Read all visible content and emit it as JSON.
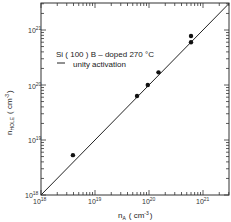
{
  "chart_data": {
    "type": "scatter",
    "title": "",
    "xlabel": "n_A (cm^-3)",
    "ylabel": "n_HOLE (cm^-3)",
    "xscale": "log",
    "yscale": "log",
    "xlim": [
      1e+18,
      3e+21
    ],
    "ylim": [
      1e+18,
      3e+21
    ],
    "xticks": [
      "10^18",
      "10^19",
      "10^20",
      "10^21"
    ],
    "yticks": [
      "10^18",
      "10^19",
      "10^20",
      "10^21"
    ],
    "grid": false,
    "legend": {
      "position": "upper-left",
      "entries": [
        {
          "label": "Si ( 100 )   B – doped 270 °C",
          "marker": "filled-circle"
        },
        {
          "label": "unity activation",
          "marker": "line"
        }
      ]
    },
    "series": [
      {
        "name": "Si (100) B-doped 270 °C",
        "type": "scatter",
        "x": [
          3.9e+18,
          6e+19,
          9.5e+19,
          1.5e+20,
          6e+20,
          6e+20
        ],
        "y": [
          5.3e+18,
          6.3e+19,
          1e+20,
          1.7e+20,
          6e+20,
          7.8e+20
        ]
      },
      {
        "name": "unity activation",
        "type": "line",
        "x": [
          1e+18,
          3e+21
        ],
        "y": [
          1e+18,
          3e+21
        ]
      }
    ]
  },
  "labels": {
    "x_axis_main": "n",
    "x_axis_sub": "A",
    "x_axis_unit": "( cm",
    "x_axis_unit_exp": "-3",
    "x_axis_unit_close": ")",
    "y_axis_main": "n",
    "y_axis_sub": "HOLE",
    "y_axis_unit": "( cm",
    "y_axis_unit_exp": "-3",
    "y_axis_unit_close": ")",
    "tick_base": "10",
    "tick_exps": [
      "18",
      "19",
      "20",
      "21"
    ],
    "legend_series": "Si ( 100 )   B – doped 270 °C",
    "legend_line": "unity activation"
  }
}
